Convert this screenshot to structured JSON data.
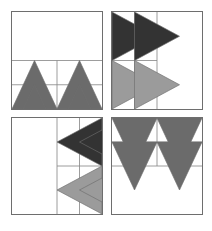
{
  "figure": {
    "background_color": "#ffffff",
    "line_color": "#6e6e6e",
    "blocks_across": 2,
    "blocks_down": 2
  },
  "palette": {
    "background": "#ffffff",
    "dark": "#333333",
    "medium": "#6b6b6b",
    "light": "#9b9b9b",
    "outline": "#6e6e6e",
    "gridline": "#8a8a8a"
  },
  "blocks": [
    {
      "id": "block-top-left",
      "name": "Flying Geese Up",
      "position": "top-left",
      "grid": "4x4",
      "unit_type": "flying-geese",
      "direction": "up",
      "filled_region": "bottom-half",
      "units": [
        {
          "row": 2,
          "col": 0,
          "fill": "medium",
          "direction": "up"
        },
        {
          "row": 2,
          "col": 2,
          "fill": "medium",
          "direction": "up"
        },
        {
          "row": 3,
          "col": 0,
          "fill": "medium",
          "direction": "up"
        },
        {
          "row": 3,
          "col": 2,
          "fill": "medium",
          "direction": "up"
        }
      ]
    },
    {
      "id": "block-top-right",
      "name": "Flying Geese Right",
      "position": "top-right",
      "grid": "4x4",
      "unit_type": "flying-geese",
      "direction": "right",
      "filled_region": "left-half",
      "units": [
        {
          "row": 0,
          "col": 0,
          "fill": "dark",
          "direction": "right"
        },
        {
          "row": 0,
          "col": 1,
          "fill": "dark",
          "direction": "right"
        },
        {
          "row": 2,
          "col": 0,
          "fill": "light",
          "direction": "right"
        },
        {
          "row": 2,
          "col": 1,
          "fill": "light",
          "direction": "right"
        }
      ]
    },
    {
      "id": "block-bottom-left",
      "name": "Flying Geese Left",
      "position": "bottom-left",
      "grid": "4x4",
      "unit_type": "flying-geese",
      "direction": "left",
      "filled_region": "right-half",
      "units": [
        {
          "row": 0,
          "col": 2,
          "fill": "dark",
          "direction": "left"
        },
        {
          "row": 0,
          "col": 3,
          "fill": "dark",
          "direction": "left"
        },
        {
          "row": 2,
          "col": 2,
          "fill": "light",
          "direction": "left"
        },
        {
          "row": 2,
          "col": 3,
          "fill": "light",
          "direction": "left"
        }
      ]
    },
    {
      "id": "block-bottom-right",
      "name": "Flying Geese Down",
      "position": "bottom-right",
      "grid": "4x4",
      "unit_type": "flying-geese",
      "direction": "down",
      "filled_region": "top-half",
      "units": [
        {
          "row": 0,
          "col": 0,
          "fill": "medium",
          "direction": "down"
        },
        {
          "row": 0,
          "col": 2,
          "fill": "medium",
          "direction": "down"
        },
        {
          "row": 1,
          "col": 0,
          "fill": "medium",
          "direction": "down"
        },
        {
          "row": 1,
          "col": 2,
          "fill": "medium",
          "direction": "down"
        }
      ]
    }
  ]
}
